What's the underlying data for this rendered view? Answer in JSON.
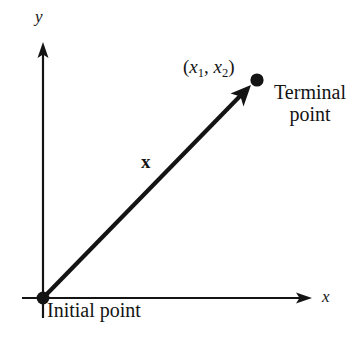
{
  "figure": {
    "type": "diagram",
    "background_color": "#ffffff",
    "ink_color": "#141414",
    "axes": {
      "x_label": "x",
      "y_label": "y",
      "origin_marker": "filled-dot",
      "x_axis": {
        "start_px": [
          22,
          298
        ],
        "end_px": [
          312,
          298
        ],
        "arrow": "right"
      },
      "y_axis": {
        "start_px": [
          43,
          318
        ],
        "end_px": [
          43,
          42
        ],
        "arrow": "up"
      }
    },
    "vector": {
      "label": "x",
      "label_style": "bold",
      "tail_px": [
        43,
        298
      ],
      "head_px": [
        251,
        85
      ],
      "arrow": "head",
      "stroke_width_px": 4
    },
    "points": [
      {
        "name": "initial-point",
        "caption": "Initial point",
        "caption_lines": [
          "Initial point"
        ],
        "position_px": [
          43,
          298
        ]
      },
      {
        "name": "terminal-point",
        "caption": "Terminal point",
        "caption_lines": [
          "Terminal",
          "point"
        ],
        "coordinate_label": "(x1, x2)",
        "coordinate_parts": {
          "open": "(",
          "first_var": "x",
          "first_sub": "1",
          "comma": ", ",
          "second_var": "x",
          "second_sub": "2",
          "close": ")"
        },
        "position_px": [
          257,
          80
        ]
      }
    ]
  }
}
